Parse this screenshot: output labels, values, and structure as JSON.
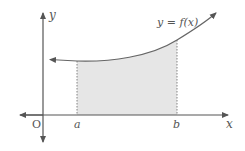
{
  "diagram": {
    "curve_label": "y = f(x)",
    "axis_x_label": "x",
    "axis_y_label": "y",
    "origin_label": "O",
    "lower_bound_label": "a",
    "upper_bound_label": "b",
    "colors": {
      "axis": "#555555",
      "curve": "#666666",
      "shade": "#e6e6e6",
      "dotted": "#777777"
    }
  }
}
